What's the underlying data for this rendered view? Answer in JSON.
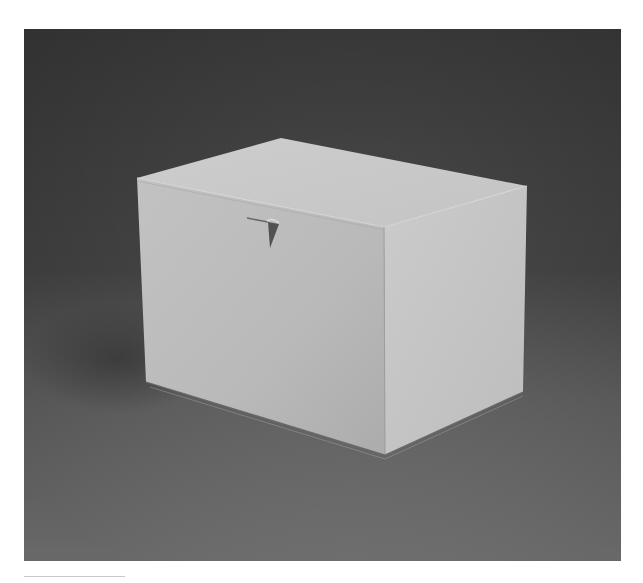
{
  "image": {
    "subject": "White cardboard box with tuck-in lid on a gray studio backdrop",
    "alt": "Photograph of a closed white rectangular box with a triangular tab on the lid",
    "colors": {
      "page_background": "#ffffff",
      "backdrop_dark": "#3e3e3e",
      "backdrop_mid": "#5a5a5a",
      "floor_light": "#8a8a8a",
      "box_front": "#bdbdbd",
      "box_right": "#c7c7c7",
      "box_top": "#c9c9c9",
      "tab_shadow": "#505050",
      "rule": "#c8c8c8"
    }
  }
}
